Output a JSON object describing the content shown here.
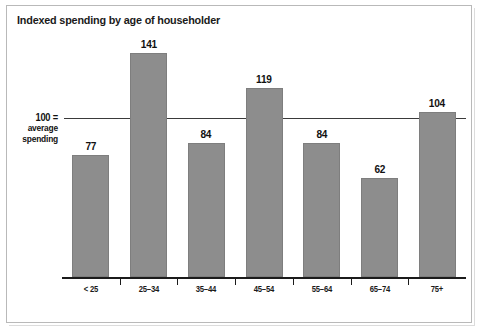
{
  "chart_data": {
    "type": "bar",
    "title": "Indexed spending by age of householder",
    "xlabel": "",
    "ylabel": "",
    "categories": [
      "< 25",
      "25–34",
      "35–44",
      "45–54",
      "55–64",
      "65–74",
      "75+"
    ],
    "values": [
      77,
      141,
      84,
      119,
      84,
      62,
      104
    ],
    "value_labels": [
      "77",
      "141",
      "84",
      "119",
      "84",
      "62",
      "104"
    ],
    "reference_line": {
      "value": 100,
      "label_lines": [
        "100 =",
        "average",
        "spending"
      ]
    },
    "ylim": [
      0,
      175
    ],
    "grid": false,
    "legend": null,
    "colors": {
      "bar_fill": "#8d8d8d",
      "bar_stroke": "#7e7e7e",
      "axis": "#1b1b1b",
      "reference_line": "#3a3a3a",
      "text": "#111111",
      "background": "#ffffff",
      "frame": "#b9b9b9"
    }
  }
}
